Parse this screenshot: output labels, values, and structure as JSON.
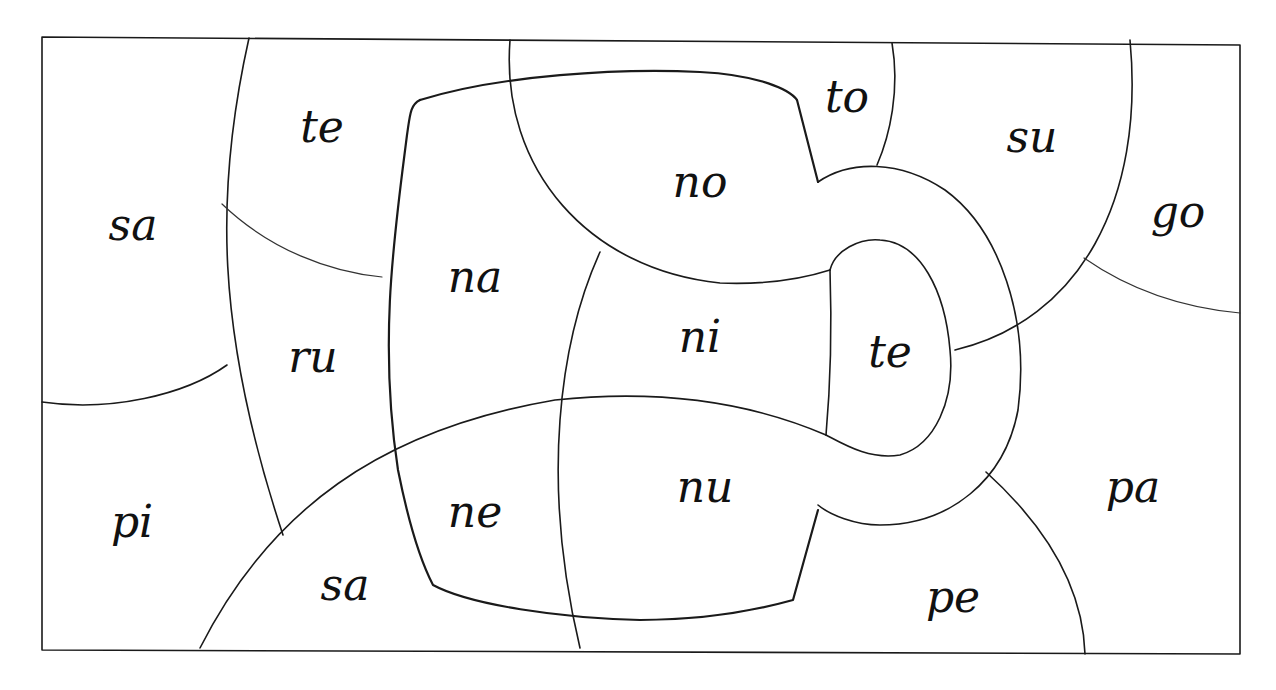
{
  "worksheet": {
    "type": "color-by-syllable puzzle",
    "frame": {
      "x": 42,
      "y": 37,
      "width": 1198,
      "height": 617
    },
    "syllables": [
      {
        "id": "sa-top-left",
        "text": "sa",
        "x": 133,
        "y": 228
      },
      {
        "id": "te-top",
        "text": "te",
        "x": 322,
        "y": 130
      },
      {
        "id": "to",
        "text": "to",
        "x": 847,
        "y": 100
      },
      {
        "id": "su",
        "text": "su",
        "x": 1032,
        "y": 140
      },
      {
        "id": "no",
        "text": "no",
        "x": 700,
        "y": 185
      },
      {
        "id": "go",
        "text": "go",
        "x": 1178,
        "y": 215
      },
      {
        "id": "na",
        "text": "na",
        "x": 475,
        "y": 280
      },
      {
        "id": "ni",
        "text": "ni",
        "x": 700,
        "y": 340
      },
      {
        "id": "te-handle",
        "text": "te",
        "x": 890,
        "y": 355
      },
      {
        "id": "ru",
        "text": "ru",
        "x": 313,
        "y": 360
      },
      {
        "id": "nu",
        "text": "nu",
        "x": 705,
        "y": 490
      },
      {
        "id": "pa",
        "text": "pa",
        "x": 1133,
        "y": 490
      },
      {
        "id": "pi",
        "text": "pi",
        "x": 132,
        "y": 525
      },
      {
        "id": "ne",
        "text": "ne",
        "x": 475,
        "y": 515
      },
      {
        "id": "sa-bottom",
        "text": "sa",
        "x": 345,
        "y": 588
      },
      {
        "id": "pe",
        "text": "pe",
        "x": 953,
        "y": 600
      }
    ]
  }
}
